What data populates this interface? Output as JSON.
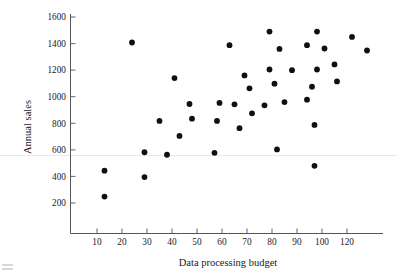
{
  "chart_data": {
    "type": "scatter",
    "title": "",
    "xlabel": "Data processing budget",
    "ylabel": "Annual sales",
    "xlim": [
      0,
      130
    ],
    "ylim": [
      100,
      1620
    ],
    "grid": false,
    "legend": null,
    "xticks": [
      10,
      20,
      30,
      40,
      50,
      60,
      70,
      80,
      90,
      100,
      120
    ],
    "xtick_labels": [
      "10",
      "20",
      "30",
      "40",
      "50",
      "60",
      "70",
      "80",
      "90",
      "100",
      "120"
    ],
    "yticks": [
      200,
      400,
      600,
      800,
      1000,
      1200,
      1400,
      1600
    ],
    "ytick_labels": [
      "200",
      "400",
      "600",
      "800",
      "1000",
      "1200",
      "1400",
      "1600"
    ],
    "marker": "filled-circle",
    "marker_color": "#101010",
    "marker_size": 3,
    "points": [
      {
        "x": 13,
        "y": 443
      },
      {
        "x": 13,
        "y": 248
      },
      {
        "x": 24,
        "y": 1408
      },
      {
        "x": 29,
        "y": 582
      },
      {
        "x": 29,
        "y": 395
      },
      {
        "x": 35,
        "y": 818
      },
      {
        "x": 38,
        "y": 563
      },
      {
        "x": 41,
        "y": 1140
      },
      {
        "x": 43,
        "y": 705
      },
      {
        "x": 47,
        "y": 945
      },
      {
        "x": 48,
        "y": 835
      },
      {
        "x": 57,
        "y": 578
      },
      {
        "x": 58,
        "y": 818
      },
      {
        "x": 59,
        "y": 953
      },
      {
        "x": 63,
        "y": 1388
      },
      {
        "x": 65,
        "y": 943
      },
      {
        "x": 67,
        "y": 763
      },
      {
        "x": 69,
        "y": 1160
      },
      {
        "x": 71,
        "y": 1063
      },
      {
        "x": 72,
        "y": 875
      },
      {
        "x": 77,
        "y": 935
      },
      {
        "x": 79,
        "y": 1205
      },
      {
        "x": 79,
        "y": 1490
      },
      {
        "x": 81,
        "y": 1098
      },
      {
        "x": 82,
        "y": 603
      },
      {
        "x": 83,
        "y": 1360
      },
      {
        "x": 85,
        "y": 960
      },
      {
        "x": 88,
        "y": 1200
      },
      {
        "x": 94,
        "y": 978
      },
      {
        "x": 94,
        "y": 1388
      },
      {
        "x": 96,
        "y": 1075
      },
      {
        "x": 97,
        "y": 480
      },
      {
        "x": 97,
        "y": 788
      },
      {
        "x": 98,
        "y": 1205
      },
      {
        "x": 98,
        "y": 1490
      },
      {
        "x": 101,
        "y": 1363
      },
      {
        "x": 105,
        "y": 1243
      },
      {
        "x": 106,
        "y": 1115
      },
      {
        "x": 112,
        "y": 1450
      },
      {
        "x": 118,
        "y": 1348
      }
    ]
  }
}
